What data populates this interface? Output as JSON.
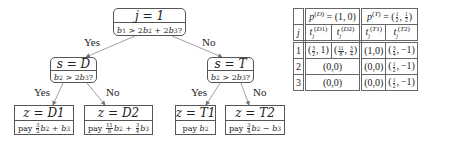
{
  "tree": {
    "root": {
      "title": "j = 1",
      "question": "b1 > 2b2 + 2b3?"
    },
    "left": {
      "title": "s = D",
      "question": "b2 > 2b3?",
      "edge_label": "Yes"
    },
    "right": {
      "title": "s = T",
      "question": "b2 > 2b3?",
      "edge_label": "No"
    },
    "leaves": [
      {
        "title": "z = D1",
        "payoff": "pay 3/2 b2 + b3",
        "edge_label": "Yes"
      },
      {
        "title": "z = D2",
        "payoff": "pay 11/8 b2 + 3/4 b3",
        "edge_label": "No"
      },
      {
        "title": "z = T1",
        "payoff": "pay b2",
        "edge_label": "Yes"
      },
      {
        "title": "z = T2",
        "payoff": "pay 3/4 b2 − b3",
        "edge_label": "No"
      }
    ],
    "labels": {
      "yes": "Yes",
      "no": "No"
    },
    "pay": "pay"
  },
  "table": {
    "group_headers": [
      "p(D) = (1,0)",
      "p(T) = (1/2, 1/2)"
    ],
    "col_headers": [
      "j",
      "t_j(D1)",
      "t_j(D2)",
      "t_j(T1)",
      "t_j(T2)"
    ],
    "rows": [
      {
        "j": "1",
        "D1": "(3/2, 1)",
        "D2": "(11/8, 3/4)",
        "T1": "(1, 0)",
        "T2": "(3/4, −1)"
      },
      {
        "j": "2",
        "D": "(0, 0)",
        "T1": "(0, 0)",
        "T2": "(1/2, −1)"
      },
      {
        "j": "3",
        "D": "(0, 0)",
        "T1": "(0, 0)",
        "T2": "(1/2, −1)"
      }
    ],
    "text": {
      "r0_j": "1",
      "r1_j": "2",
      "r2_j": "3",
      "tuple_10": "(1,0)",
      "tuple_00": "(0,0)"
    }
  }
}
